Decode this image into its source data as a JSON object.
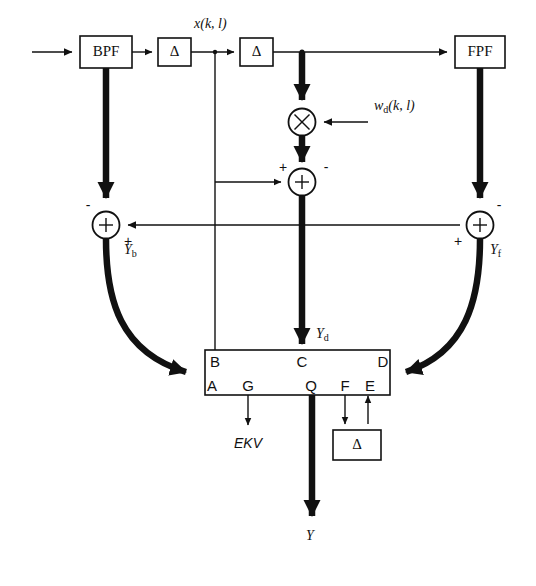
{
  "diagram": {
    "blocks": [
      {
        "id": "bpf",
        "label": "BPF"
      },
      {
        "id": "delta1",
        "label": "Δ"
      },
      {
        "id": "delta2",
        "label": "Δ"
      },
      {
        "id": "fpf",
        "label": "FPF"
      },
      {
        "id": "delta3",
        "label": "Δ"
      }
    ],
    "operators": [
      {
        "id": "multiplier",
        "label": "X"
      },
      {
        "id": "summer-center",
        "label": "+"
      },
      {
        "id": "summer-left",
        "label": "+"
      },
      {
        "id": "summer-right",
        "label": "+"
      }
    ],
    "signal_labels": {
      "input_x": "x(k, l)",
      "weight_wd": "w",
      "weight_wd_sub": "d",
      "weight_wd_rest": "(k, l)",
      "y_b": "Y",
      "y_b_sub": "b",
      "y_d": "Y",
      "y_d_sub": "d",
      "y_f": "Y",
      "y_f_sub": "f",
      "y_out": "Y",
      "ekv": "EKV"
    },
    "signs": {
      "center_plus": "+",
      "center_minus": "-",
      "left_minus": "-",
      "left_plus": "+",
      "right_minus": "-",
      "right_plus": "+"
    },
    "processor": {
      "id": "processor-block",
      "ports_top": [
        "B",
        "C",
        "D"
      ],
      "ports_bottom": [
        "A",
        "G",
        "Q",
        "F",
        "E"
      ]
    },
    "colors": {
      "line": "#111111",
      "background": "#ffffff"
    }
  }
}
